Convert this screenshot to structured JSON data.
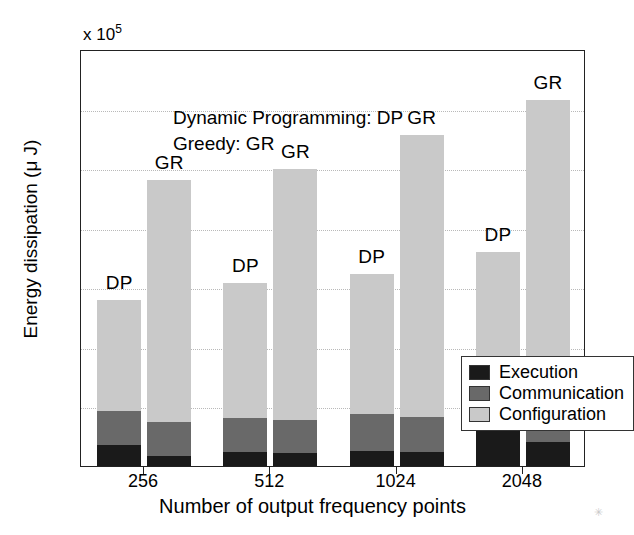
{
  "chart_data": {
    "type": "bar",
    "subtype": "grouped-stacked",
    "title": "",
    "xlabel": "Number of output frequency points",
    "ylabel": "Energy dissipation (μ J)",
    "y_multiplier_text": "x 10",
    "y_multiplier_exp": "5",
    "categories": [
      "256",
      "512",
      "1024",
      "2048"
    ],
    "group_members": [
      "DP",
      "GR"
    ],
    "ylim": [
      0,
      7
    ],
    "yticks": [
      0,
      1,
      2,
      3,
      4,
      5,
      6,
      7
    ],
    "ytick_labels": [
      "0",
      "1",
      "2",
      "3",
      "4",
      "5",
      "6",
      "7"
    ],
    "grid": "horizontal-dotted",
    "legend_position": "center-right-inside",
    "stack_order_bottom_to_top": [
      "Execution",
      "Communication",
      "Configuration"
    ],
    "series": [
      {
        "name": "Execution",
        "color": "#1a1a1a",
        "dp_values": [
          0.35,
          0.23,
          0.26,
          0.58
        ],
        "gr_values": [
          0.17,
          0.22,
          0.24,
          0.4
        ]
      },
      {
        "name": "Communication",
        "color": "#696969",
        "dp_values": [
          0.58,
          0.57,
          0.62,
          0.55
        ],
        "gr_values": [
          0.57,
          0.55,
          0.58,
          0.6
        ]
      },
      {
        "name": "Configuration",
        "color": "#c9c9c9",
        "dp_values": [
          1.85,
          2.28,
          2.35,
          2.47
        ],
        "gr_values": [
          4.06,
          4.21,
          4.73,
          5.15
        ]
      }
    ],
    "totals": {
      "dp": [
        2.78,
        3.08,
        3.23,
        3.6
      ],
      "gr": [
        4.8,
        4.98,
        5.55,
        6.15
      ]
    },
    "cumulative_tops": {
      "dp_execution": [
        0.35,
        0.23,
        0.26,
        0.58
      ],
      "dp_communication": [
        0.93,
        0.8,
        0.88,
        1.13
      ],
      "dp_total": [
        2.78,
        3.08,
        3.23,
        3.6
      ],
      "gr_execution": [
        0.17,
        0.22,
        0.24,
        0.4
      ],
      "gr_communication": [
        0.74,
        0.77,
        0.82,
        1.0
      ],
      "gr_total": [
        4.8,
        4.98,
        5.55,
        6.15
      ]
    },
    "bar_annotations": [
      "DP",
      "GR",
      "DP",
      "GR",
      "DP",
      "GR",
      "DP",
      "GR"
    ]
  },
  "note": {
    "line1": "Dynamic Programming: DP",
    "line2": "Greedy: GR"
  },
  "legend": {
    "items": [
      {
        "label": "Execution",
        "color": "#1a1a1a"
      },
      {
        "label": "Communication",
        "color": "#696969"
      },
      {
        "label": "Configuration",
        "color": "#c9c9c9"
      }
    ]
  },
  "artifact": {
    "mark": "✳"
  }
}
